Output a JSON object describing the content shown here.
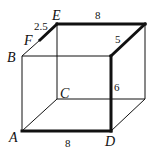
{
  "diagram": {
    "type": "rectangular-prism",
    "points": {
      "A": {
        "label": "A",
        "x": 22,
        "y": 131
      },
      "B": {
        "label": "B",
        "x": 22,
        "y": 56
      },
      "C": {
        "label": "C",
        "x": 57,
        "y": 99
      },
      "D": {
        "label": "D",
        "x": 111,
        "y": 131
      },
      "E": {
        "label": "E",
        "x": 57,
        "y": 24
      },
      "F": {
        "label": "F",
        "x": 40,
        "y": 40
      },
      "G": {
        "x": 111,
        "y": 56
      },
      "H": {
        "x": 145,
        "y": 24
      },
      "I": {
        "x": 145,
        "y": 99
      }
    },
    "vertex_labels": {
      "A": "A",
      "B": "B",
      "C": "C",
      "D": "D",
      "E": "E",
      "F": "F"
    },
    "edge_labels": {
      "FE": "2.5",
      "EH_top": "8",
      "HG_depth": "5",
      "GD_height": "6",
      "AD_bottom": "8"
    },
    "path_highlight": [
      "F",
      "E",
      "H",
      "G",
      "D",
      "A"
    ],
    "colors": {
      "line": "#111111",
      "background": "#ffffff"
    }
  }
}
